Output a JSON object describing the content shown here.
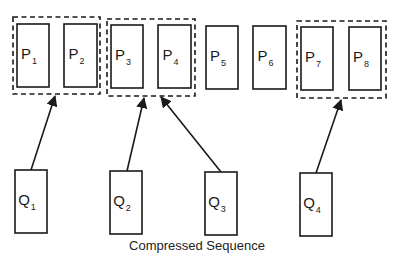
{
  "diagram": {
    "caption": "Compressed Sequence",
    "colors": {
      "stroke": "#1a1a1a",
      "background": "#ffffff"
    },
    "original_sequence": [
      {
        "id": "P1",
        "base": "P",
        "sub": "1",
        "x": 17,
        "y": 24,
        "w": 32,
        "h": 63
      },
      {
        "id": "P2",
        "base": "P",
        "sub": "2",
        "x": 64,
        "y": 24,
        "w": 33,
        "h": 63
      },
      {
        "id": "P3",
        "base": "P",
        "sub": "3",
        "x": 111,
        "y": 25,
        "w": 32,
        "h": 63
      },
      {
        "id": "P4",
        "base": "P",
        "sub": "4",
        "x": 158,
        "y": 25,
        "w": 33,
        "h": 63
      },
      {
        "id": "P5",
        "base": "P",
        "sub": "5",
        "x": 206,
        "y": 26,
        "w": 32,
        "h": 63
      },
      {
        "id": "P6",
        "base": "P",
        "sub": "6",
        "x": 253,
        "y": 26,
        "w": 33,
        "h": 63
      },
      {
        "id": "P7",
        "base": "P",
        "sub": "7",
        "x": 301,
        "y": 27,
        "w": 32,
        "h": 63
      },
      {
        "id": "P8",
        "base": "P",
        "sub": "8",
        "x": 349,
        "y": 27,
        "w": 32,
        "h": 63
      }
    ],
    "groups": [
      {
        "id": "group-1",
        "members": [
          "P1",
          "P2"
        ],
        "x": 13,
        "y": 17,
        "w": 87,
        "h": 77
      },
      {
        "id": "group-2",
        "members": [
          "P3",
          "P4"
        ],
        "x": 107,
        "y": 19,
        "w": 88,
        "h": 77
      },
      {
        "id": "group-3",
        "members": [
          "P7",
          "P8"
        ],
        "x": 297,
        "y": 21,
        "w": 89,
        "h": 77
      }
    ],
    "compressed_sequence": [
      {
        "id": "Q1",
        "base": "Q",
        "sub": "1",
        "x": 15,
        "y": 170,
        "w": 32,
        "h": 63
      },
      {
        "id": "Q2",
        "base": "Q",
        "sub": "2",
        "x": 110,
        "y": 171,
        "w": 32,
        "h": 63
      },
      {
        "id": "Q3",
        "base": "Q",
        "sub": "3",
        "x": 205,
        "y": 172,
        "w": 32,
        "h": 63
      },
      {
        "id": "Q4",
        "base": "Q",
        "sub": "4",
        "x": 300,
        "y": 173,
        "w": 32,
        "h": 63
      }
    ],
    "arrows": [
      {
        "from": "Q1",
        "to": "group-1",
        "x1": 31,
        "y1": 170,
        "x2": 55,
        "y2": 96
      },
      {
        "from": "Q2",
        "to": "group-2",
        "x1": 127,
        "y1": 171,
        "x2": 144,
        "y2": 98
      },
      {
        "from": "Q3",
        "to": "group-2",
        "x1": 221,
        "y1": 172,
        "x2": 161,
        "y2": 97
      },
      {
        "from": "Q4",
        "to": "group-3",
        "x1": 316,
        "y1": 173,
        "x2": 341,
        "y2": 100
      }
    ]
  }
}
